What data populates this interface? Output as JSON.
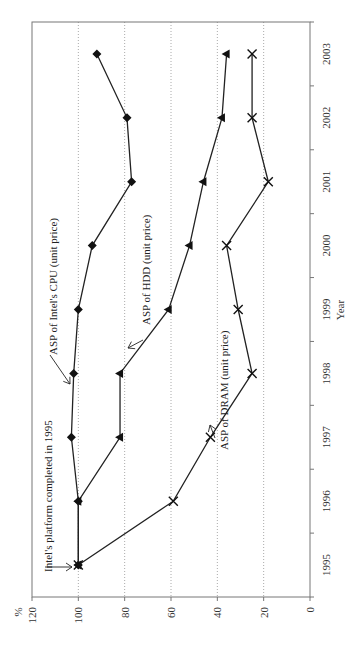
{
  "chart_data": {
    "type": "line",
    "orientation": "rotated-90-clockwise",
    "title": "",
    "xlabel": "Year",
    "ylabel": "%",
    "ylim": [
      0,
      120
    ],
    "yticks": [
      0,
      20,
      40,
      60,
      80,
      100,
      120
    ],
    "categories": [
      "1995",
      "1996",
      "1997",
      "1998",
      "1999",
      "2000",
      "2001",
      "2002",
      "2003"
    ],
    "grid": "dotted lines at each y tick",
    "legend": "none (inline annotations)",
    "series": [
      {
        "name": "ASP of Intel's CPU (unit price)",
        "marker": "diamond",
        "values": [
          100,
          100,
          103,
          102,
          100,
          94,
          77,
          79,
          92
        ]
      },
      {
        "name": "ASP of HDD (unit price)",
        "marker": "triangle",
        "values": [
          100,
          100,
          82,
          82,
          61,
          52,
          46,
          38,
          36
        ]
      },
      {
        "name": "ASP of DRAM (unit price)",
        "marker": "x",
        "values": [
          100,
          59,
          43,
          25,
          31,
          36,
          18,
          25,
          25
        ]
      }
    ],
    "annotations": [
      {
        "text": "ASP of Intel's CPU (unit price)",
        "points_to": "CPU 1999"
      },
      {
        "text": "ASP of HDD (unit price)",
        "points_to": "HDD 1999"
      },
      {
        "text": "ASP of DRAM (unit price)",
        "points_to": "DRAM 1997"
      },
      {
        "text": "Intel's platform completed in 1995",
        "points_to": "1995 start point"
      }
    ]
  }
}
